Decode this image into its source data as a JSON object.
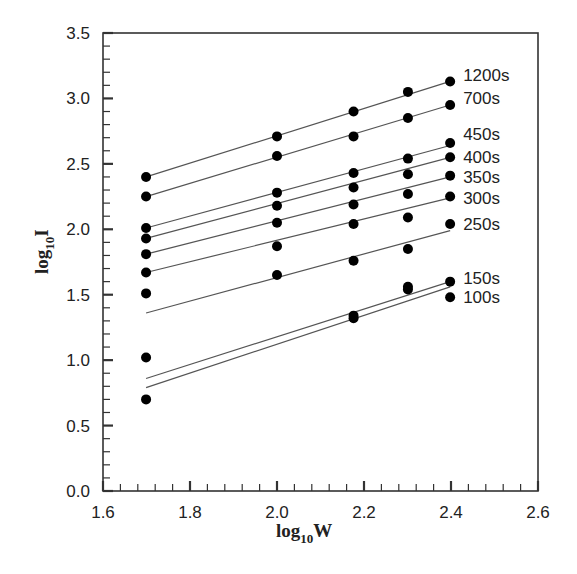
{
  "chart_data": {
    "type": "scatter",
    "title": "",
    "xlabel": "log10W",
    "ylabel": "log10I",
    "xlabel_parts": {
      "base": "log",
      "sub": "10",
      "var": "W"
    },
    "ylabel_parts": {
      "base": "log",
      "sub": "10",
      "var": "I"
    },
    "xlim": [
      1.6,
      2.6
    ],
    "ylim": [
      0.0,
      3.5
    ],
    "x_ticks": [
      "1.6",
      "1.8",
      "2.0",
      "2.2",
      "2.4",
      "2.6"
    ],
    "y_ticks": [
      "0.0",
      "0.5",
      "1.0",
      "1.5",
      "2.0",
      "2.5",
      "3.0",
      "3.5"
    ],
    "grid": false,
    "legend_position": "inline labels at right end of each series",
    "x": [
      1.699,
      2.0,
      2.176,
      2.301,
      2.398
    ],
    "series": [
      {
        "name": "1200s",
        "values": [
          2.4,
          2.71,
          2.9,
          3.05,
          3.13
        ],
        "fit": [
          2.4,
          3.13
        ]
      },
      {
        "name": "700s",
        "values": [
          2.25,
          2.56,
          2.71,
          2.85,
          2.95
        ],
        "fit": [
          2.25,
          2.95
        ]
      },
      {
        "name": "450s",
        "values": [
          2.01,
          2.28,
          2.43,
          2.54,
          2.66
        ],
        "fit": [
          2.01,
          2.64
        ]
      },
      {
        "name": "400s",
        "values": [
          1.93,
          2.18,
          2.32,
          2.42,
          2.55
        ],
        "fit": [
          1.93,
          2.55
        ]
      },
      {
        "name": "350s",
        "values": [
          1.81,
          2.05,
          2.19,
          2.27,
          2.41
        ],
        "fit": [
          1.81,
          2.4
        ]
      },
      {
        "name": "300s",
        "values": [
          1.67,
          1.87,
          2.04,
          2.09,
          2.25
        ],
        "fit": [
          1.67,
          2.24
        ]
      },
      {
        "name": "250s",
        "values": [
          1.51,
          1.65,
          1.76,
          1.85,
          2.04
        ],
        "fit": [
          1.36,
          1.99
        ]
      },
      {
        "name": "150s",
        "values": [
          1.02,
          null,
          1.34,
          1.56,
          1.6
        ],
        "fit": [
          0.86,
          1.6
        ]
      },
      {
        "name": "100s",
        "values": [
          0.7,
          null,
          1.32,
          1.54,
          1.48
        ],
        "fit": [
          0.79,
          1.56
        ]
      }
    ],
    "label_y_offsets": {
      "1200s": 3.18,
      "700s": 3.0,
      "450s": 2.73,
      "400s": 2.55,
      "350s": 2.4,
      "300s": 2.24,
      "250s": 2.04,
      "150s": 1.63,
      "100s": 1.48
    }
  }
}
